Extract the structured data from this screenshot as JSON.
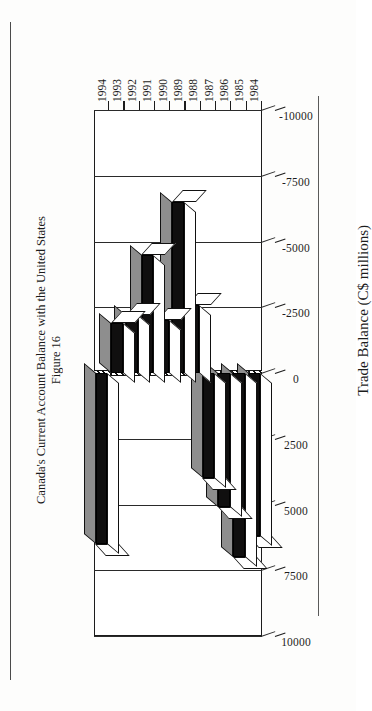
{
  "figure": {
    "caption_line1": "Figure 16",
    "caption_line2": "Canada's Current Account Balance with the United States"
  },
  "chart_data": {
    "type": "bar",
    "orientation": "vertical-3d",
    "title": "Canada's Current Account Balance with the United States",
    "xlabel": "",
    "ylabel": "Trade Balance (C$ millions)",
    "categories": [
      "1984",
      "1985",
      "1986",
      "1987",
      "1988",
      "1989",
      "1990",
      "1991",
      "1992",
      "1993",
      "1994"
    ],
    "values": [
      6200,
      7000,
      5100,
      4000,
      -2600,
      -6500,
      -2000,
      -4500,
      -2200,
      -1900,
      6500
    ],
    "ylim": [
      -10000,
      10000
    ],
    "yticks": [
      -10000,
      -7500,
      -5000,
      -2500,
      0,
      2500,
      5000,
      7500,
      10000
    ],
    "ticklabels": [
      "-10000",
      "-7500",
      "-5000",
      "-2500",
      "0",
      "2500",
      "5000",
      "7500",
      "10000"
    ],
    "grid": true,
    "legend": null,
    "series": [
      {
        "name": "Trade Balance (C$ millions)",
        "values": [
          6200,
          7000,
          5100,
          4000,
          -2600,
          -6500,
          -2000,
          -4500,
          -2200,
          -1900,
          6500
        ]
      }
    ]
  },
  "colors": {
    "bar_face": "#100f0f",
    "bar_shadow": "#8e8e8e",
    "axis": "#1c1c1c",
    "page": "#fdfdfc"
  }
}
